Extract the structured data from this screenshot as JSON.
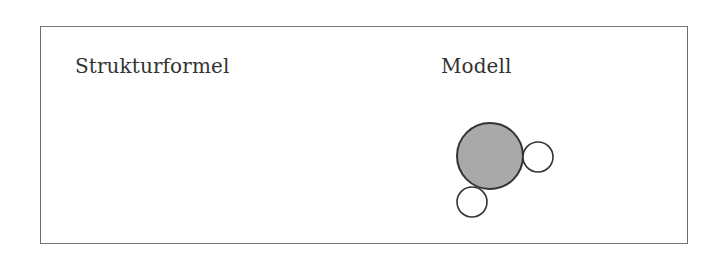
{
  "headings": {
    "left": "Strukturformel",
    "right": "Modell"
  },
  "model": {
    "central_atom": {
      "cx": 490,
      "cy": 156,
      "r": 33,
      "fill": "#a9a9a9",
      "stroke": "#333333"
    },
    "small_atoms": [
      {
        "cx": 538,
        "cy": 157,
        "r": 15,
        "fill": "#ffffff",
        "stroke": "#333333"
      },
      {
        "cx": 472,
        "cy": 202,
        "r": 15,
        "fill": "#ffffff",
        "stroke": "#333333"
      }
    ]
  },
  "colors": {
    "border": "#6a6a6a",
    "text": "#333333",
    "atom_fill": "#a9a9a9"
  }
}
